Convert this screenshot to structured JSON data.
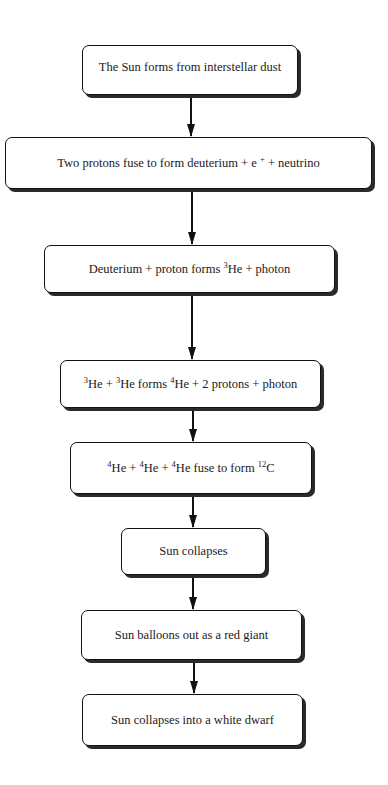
{
  "diagram": {
    "type": "flowchart",
    "direction": "top-to-bottom",
    "steps": [
      {
        "id": "step-1",
        "parts": [
          {
            "t": "The Sun forms from interstellar dust"
          }
        ],
        "text": "The Sun forms from interstellar dust"
      },
      {
        "id": "step-2",
        "parts": [
          {
            "t": "Two protons fuse to form deuterium + e "
          },
          {
            "sup": "+"
          },
          {
            "t": " + neutrino"
          }
        ],
        "text": "Two protons fuse to form deuterium + e+ + neutrino"
      },
      {
        "id": "step-3",
        "parts": [
          {
            "t": "Deuterium + proton forms "
          },
          {
            "sup": "3"
          },
          {
            "t": "He + photon"
          }
        ],
        "text": "Deuterium + proton forms 3He + photon"
      },
      {
        "id": "step-4",
        "parts": [
          {
            "sup": "3"
          },
          {
            "t": "He + "
          },
          {
            "sup": "3"
          },
          {
            "t": "He  forms "
          },
          {
            "sup": "4"
          },
          {
            "t": "He + 2 protons + photon"
          }
        ],
        "text": "3He + 3He forms 4He + 2 protons + photon"
      },
      {
        "id": "step-5",
        "parts": [
          {
            "sup": "4"
          },
          {
            "t": "He + "
          },
          {
            "sup": "4"
          },
          {
            "t": "He + "
          },
          {
            "sup": "4"
          },
          {
            "t": "He fuse to form "
          },
          {
            "sup": "12"
          },
          {
            "t": "C"
          }
        ],
        "text": "4He + 4He + 4He fuse to form 12C"
      },
      {
        "id": "step-6",
        "parts": [
          {
            "t": "Sun collapses"
          }
        ],
        "text": "Sun collapses"
      },
      {
        "id": "step-7",
        "parts": [
          {
            "t": "Sun balloons out as a red giant"
          }
        ],
        "text": "Sun balloons out as a red giant"
      },
      {
        "id": "step-8",
        "parts": [
          {
            "t": "Sun collapses into a white dwarf"
          }
        ],
        "text": "Sun collapses into a white dwarf"
      }
    ],
    "edges": [
      {
        "from": "step-1",
        "to": "step-2"
      },
      {
        "from": "step-2",
        "to": "step-3"
      },
      {
        "from": "step-3",
        "to": "step-4"
      },
      {
        "from": "step-4",
        "to": "step-5"
      },
      {
        "from": "step-5",
        "to": "step-6"
      },
      {
        "from": "step-6",
        "to": "step-7"
      },
      {
        "from": "step-7",
        "to": "step-8"
      }
    ],
    "colors": {
      "box_fill": "#ffffff",
      "box_border": "#111111",
      "shadow": "#2a2a2a",
      "arrow": "#111111",
      "background": "#ffffff"
    }
  }
}
